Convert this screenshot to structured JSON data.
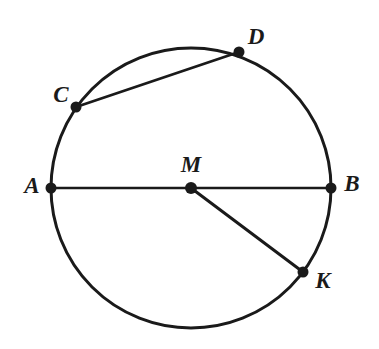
{
  "figure": {
    "kind": "circle-geometry-diagram",
    "background_color": "#ffffff",
    "stroke_color": "#1a1a1a",
    "label_color": "#1a1a1a",
    "width": 379,
    "height": 349
  },
  "circle": {
    "name": "circle-M",
    "center_x": 191,
    "center_y": 188,
    "radius": 140,
    "stroke_width": 3
  },
  "points": [
    {
      "id": "A",
      "label": "A",
      "x": 51,
      "y": 188,
      "label_x": 32,
      "label_y": 188,
      "label_anchor": "middle",
      "dot_radius": 5.5,
      "role": "diameter-endpoint-left"
    },
    {
      "id": "B",
      "label": "B",
      "x": 331,
      "y": 188,
      "label_x": 352,
      "label_y": 186,
      "label_anchor": "middle",
      "dot_radius": 5.5,
      "role": "diameter-endpoint-right"
    },
    {
      "id": "M",
      "label": "M",
      "x": 191,
      "y": 188,
      "label_x": 191,
      "label_y": 167,
      "label_anchor": "middle",
      "dot_radius": 6,
      "role": "center"
    },
    {
      "id": "C",
      "label": "C",
      "x": 76,
      "y": 107,
      "label_x": 61,
      "label_y": 97,
      "label_anchor": "middle",
      "dot_radius": 5.5,
      "role": "chord-endpoint-left"
    },
    {
      "id": "D",
      "label": "D",
      "x": 239,
      "y": 52,
      "label_x": 256,
      "label_y": 39,
      "label_anchor": "middle",
      "dot_radius": 5.5,
      "role": "chord-endpoint-right"
    },
    {
      "id": "K",
      "label": "K",
      "x": 303,
      "y": 272,
      "label_x": 323,
      "label_y": 283,
      "label_anchor": "middle",
      "dot_radius": 5.5,
      "role": "radius-endpoint"
    }
  ],
  "segments": [
    {
      "id": "AB",
      "name": "diameter-ab",
      "from": "A",
      "to": "B",
      "x1": 51,
      "y1": 188,
      "x2": 331,
      "y2": 188,
      "stroke_width": 2.6,
      "kind": "diameter"
    },
    {
      "id": "CD",
      "name": "chord-cd",
      "from": "C",
      "to": "D",
      "x1": 76,
      "y1": 107,
      "x2": 239,
      "y2": 52,
      "stroke_width": 2.8,
      "kind": "chord"
    },
    {
      "id": "MK",
      "name": "radius-mk",
      "from": "M",
      "to": "K",
      "x1": 191,
      "y1": 188,
      "x2": 303,
      "y2": 272,
      "stroke_width": 3,
      "kind": "radius"
    }
  ]
}
